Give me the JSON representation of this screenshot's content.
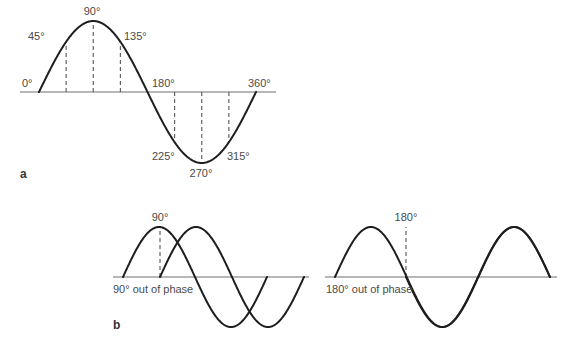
{
  "colors": {
    "background": "#ffffff",
    "wave": "#1e1e1e",
    "axis": "#707070",
    "dashed_marker": "#555555",
    "text": "#4a4a4a"
  },
  "panel_a": {
    "label": "a",
    "axis": {
      "x1": 20,
      "x2": 276,
      "y": 92
    },
    "wave": {
      "x_start": 39,
      "x_end": 256,
      "baseline_y": 92,
      "amplitude": 71,
      "phase_deg": 0,
      "cycles": 1
    },
    "angle_labels": [
      {
        "text": "0°",
        "x": 22,
        "y": 87,
        "anchor": "start"
      },
      {
        "text": "45°",
        "x": 28,
        "y": 40,
        "anchor": "start"
      },
      {
        "text": "90°",
        "x": 92,
        "y": 15,
        "anchor": "middle"
      },
      {
        "text": "135°",
        "x": 124,
        "y": 40,
        "anchor": "start"
      },
      {
        "text": "180°",
        "x": 152,
        "y": 87,
        "anchor": "start"
      },
      {
        "text": "360°",
        "x": 248,
        "y": 87,
        "anchor": "start"
      },
      {
        "text": "225°",
        "x": 152,
        "y": 160,
        "anchor": "start"
      },
      {
        "text": "270°",
        "x": 201,
        "y": 177,
        "anchor": "middle"
      },
      {
        "text": "315°",
        "x": 227,
        "y": 160,
        "anchor": "start"
      }
    ],
    "dashed_markers": [
      {
        "angle": 45,
        "x": 65
      },
      {
        "angle": 90,
        "x": 92
      },
      {
        "angle": 135,
        "x": 119
      },
      {
        "angle": 225,
        "x": 174
      },
      {
        "angle": 270,
        "x": 201
      },
      {
        "angle": 315,
        "x": 229
      }
    ]
  },
  "panel_b": {
    "label": "b",
    "left": {
      "caption": "90° out of phase",
      "marker_label": "90°",
      "axis": {
        "x1": 113,
        "x2": 309,
        "y": 277
      },
      "waves": [
        {
          "name": "wave-1",
          "x_start": 123,
          "x_end": 267,
          "baseline_y": 277,
          "amplitude": 50,
          "phase_deg": 0
        },
        {
          "name": "wave-2",
          "x_start": 160,
          "x_end": 304,
          "baseline_y": 277,
          "amplitude": 50,
          "phase_deg": 0
        }
      ],
      "marker_x": 160
    },
    "right": {
      "caption": "180° out of phase",
      "marker_label": "180°",
      "axis": {
        "x1": 325,
        "x2": 557,
        "y": 277
      },
      "waves": [
        {
          "name": "wave-1",
          "x_start": 335,
          "x_end": 550,
          "baseline_y": 277,
          "amplitude": 50,
          "phase_deg": 0,
          "cycles": 1.5
        },
        {
          "name": "wave-2",
          "x_start": 406,
          "x_end": 550,
          "baseline_y": 277,
          "amplitude": 50,
          "phase_deg": 180,
          "cycles": 1
        }
      ],
      "marker_x": 406
    }
  }
}
